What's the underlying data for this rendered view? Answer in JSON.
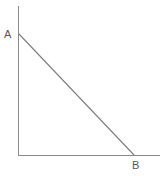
{
  "figure": {
    "canvas": {
      "width": 162,
      "height": 176,
      "background": "#ffffff"
    },
    "colors": {
      "axis": "#8a8a8a",
      "segment": "#7d7d7d",
      "label_text": "#565656"
    },
    "axes": {
      "vertical": {
        "x": 18,
        "y_top": 6,
        "y_bottom": 155
      },
      "horizontal": {
        "y": 155,
        "x_left": 18,
        "x_right": 160
      }
    },
    "segment": {
      "name": "segment-ab",
      "from": {
        "x": 18,
        "y": 34
      },
      "to": {
        "x": 134,
        "y": 155
      }
    },
    "labels": {
      "a": "A",
      "b": "B"
    }
  }
}
